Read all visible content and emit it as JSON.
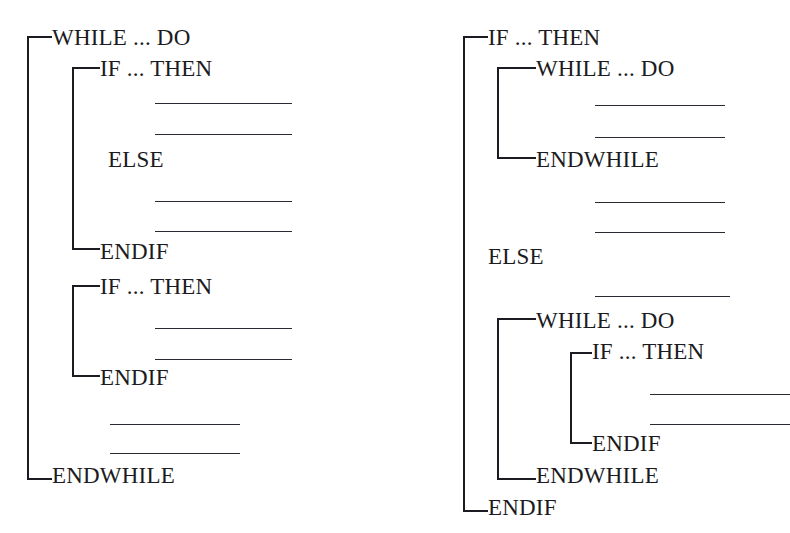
{
  "figure": {
    "background_color": "#ffffff",
    "ink_color": "#1b1b22"
  },
  "diagrams": [
    {
      "name": "left-diagram",
      "statements": [
        {
          "id": "l1",
          "label": "WHILE ... DO",
          "x": 52,
          "y": 26
        },
        {
          "id": "l2",
          "label": "IF ... THEN",
          "x": 100,
          "y": 57
        },
        {
          "id": "l3",
          "label": "ELSE",
          "x": 108,
          "y": 148
        },
        {
          "id": "l4",
          "label": "ENDIF",
          "x": 100,
          "y": 240
        },
        {
          "id": "l5",
          "label": "IF ... THEN",
          "x": 100,
          "y": 275
        },
        {
          "id": "l6",
          "label": "ENDIF",
          "x": 100,
          "y": 366
        },
        {
          "id": "l7",
          "label": "ENDWHILE",
          "x": 52,
          "y": 464
        }
      ],
      "rules": [
        {
          "id": "lr1",
          "x": 155,
          "y": 103,
          "width": 137
        },
        {
          "id": "lr2",
          "x": 155,
          "y": 134,
          "width": 137
        },
        {
          "id": "lr3",
          "x": 155,
          "y": 201,
          "width": 137
        },
        {
          "id": "lr4",
          "x": 155,
          "y": 231,
          "width": 137
        },
        {
          "id": "lr5",
          "x": 155,
          "y": 328,
          "width": 137
        },
        {
          "id": "lr6",
          "x": 155,
          "y": 359,
          "width": 137
        },
        {
          "id": "lr7",
          "x": 110,
          "y": 424,
          "width": 130
        },
        {
          "id": "lr8",
          "x": 110,
          "y": 453,
          "width": 130
        }
      ],
      "brackets": [
        {
          "id": "lb1",
          "name": "while-bracket",
          "x": 27,
          "y": 36,
          "width": 25,
          "height": 444
        },
        {
          "id": "lb2",
          "name": "if-bracket-1",
          "x": 72,
          "y": 67,
          "width": 28,
          "height": 183
        },
        {
          "id": "lb3",
          "name": "if-bracket-2",
          "x": 72,
          "y": 285,
          "width": 28,
          "height": 92
        }
      ]
    },
    {
      "name": "right-diagram",
      "statements": [
        {
          "id": "r1",
          "label": "IF ... THEN",
          "x": 488,
          "y": 26
        },
        {
          "id": "r2",
          "label": "WHILE ... DO",
          "x": 536,
          "y": 57
        },
        {
          "id": "r3",
          "label": "ENDWHILE",
          "x": 536,
          "y": 148
        },
        {
          "id": "r4",
          "label": "ELSE",
          "x": 488,
          "y": 245
        },
        {
          "id": "r5",
          "label": "WHILE ... DO",
          "x": 536,
          "y": 309
        },
        {
          "id": "r6",
          "label": "IF ... THEN",
          "x": 592,
          "y": 340
        },
        {
          "id": "r7",
          "label": "ENDIF",
          "x": 592,
          "y": 432
        },
        {
          "id": "r8",
          "label": "ENDWHILE",
          "x": 536,
          "y": 464
        },
        {
          "id": "r9",
          "label": "ENDIF",
          "x": 488,
          "y": 496
        }
      ],
      "rules": [
        {
          "id": "rr1",
          "x": 595,
          "y": 105,
          "width": 130
        },
        {
          "id": "rr2",
          "x": 595,
          "y": 137,
          "width": 130
        },
        {
          "id": "rr3",
          "x": 595,
          "y": 202,
          "width": 130
        },
        {
          "id": "rr4",
          "x": 595,
          "y": 232,
          "width": 130
        },
        {
          "id": "rr5",
          "x": 595,
          "y": 296,
          "width": 135
        },
        {
          "id": "rr6",
          "x": 650,
          "y": 394,
          "width": 140
        },
        {
          "id": "rr7",
          "x": 650,
          "y": 424,
          "width": 140
        }
      ],
      "brackets": [
        {
          "id": "rb1",
          "name": "if-bracket-outer",
          "x": 463,
          "y": 36,
          "width": 25,
          "height": 476
        },
        {
          "id": "rb2",
          "name": "while-bracket-1",
          "x": 497,
          "y": 67,
          "width": 39,
          "height": 92
        },
        {
          "id": "rb3",
          "name": "while-bracket-2",
          "x": 497,
          "y": 318,
          "width": 39,
          "height": 162
        },
        {
          "id": "rb4",
          "name": "if-bracket-inner",
          "x": 570,
          "y": 352,
          "width": 22,
          "height": 92
        }
      ]
    }
  ]
}
